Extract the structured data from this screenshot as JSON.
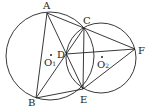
{
  "figure": {
    "type": "two intersecting circles with inscribed segments",
    "labels": {
      "A": "A",
      "B": "B",
      "C": "C",
      "D": "D",
      "E": "E",
      "F": "F",
      "O1": "O",
      "O1_sub": "1",
      "O2": "O",
      "O2_sub": "2"
    },
    "points": {
      "A": [
        47,
        13
      ],
      "B": [
        36,
        98
      ],
      "C": [
        84,
        28
      ],
      "D": [
        66,
        54
      ],
      "E": [
        83,
        89
      ],
      "F": [
        135,
        49
      ],
      "O1": [
        51,
        56
      ],
      "O2": [
        102,
        58
      ]
    },
    "circles": [
      {
        "name": "circle-O1",
        "center": [
          50,
          56
        ],
        "r": 44
      },
      {
        "name": "circle-O2",
        "center": [
          101,
          58
        ],
        "r": 35
      }
    ],
    "segments": [
      "AB",
      "AC",
      "AE",
      "BC",
      "BE",
      "CF",
      "DF",
      "EF",
      "CE"
    ],
    "stroke_color": "#222222"
  }
}
